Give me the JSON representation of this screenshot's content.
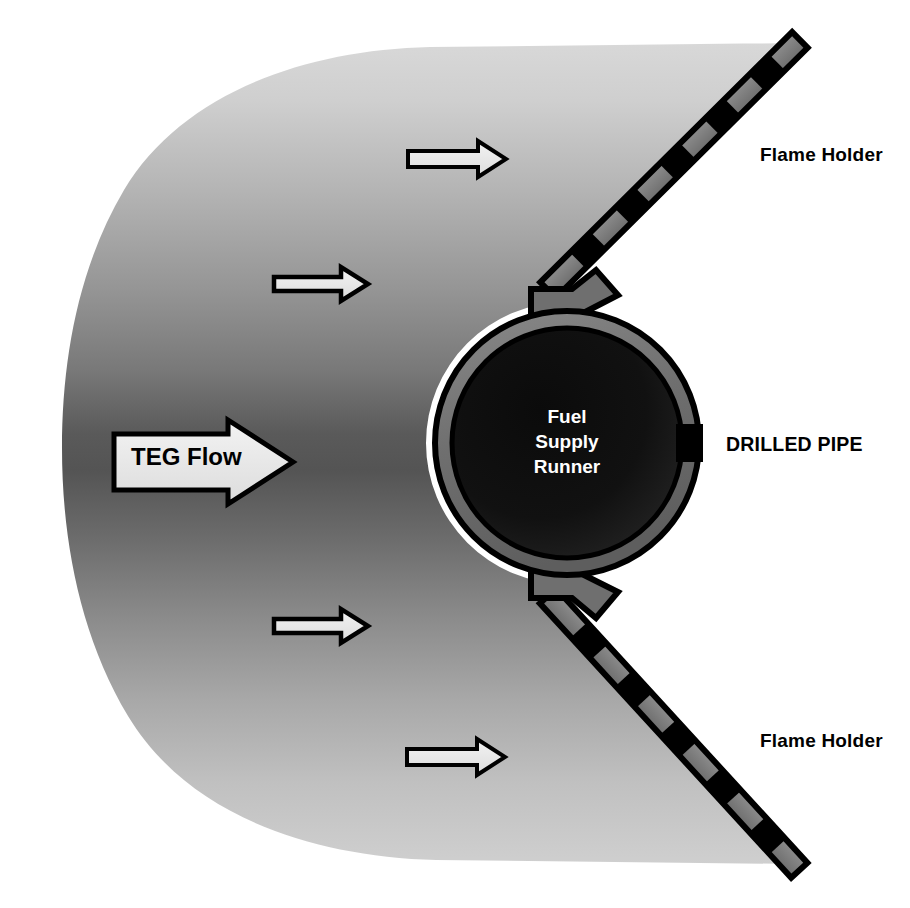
{
  "diagram": {
    "title_present": false,
    "background_color": "#ffffff",
    "labels": {
      "flame_holder_top": "Flame Holder",
      "flame_holder_bottom": "Flame Holder",
      "drilled_pipe": "DRILLED PIPE",
      "teg_flow": "TEG Flow",
      "fuel_supply_runner_line1": "Fuel",
      "fuel_supply_runner_line2": "Supply",
      "fuel_supply_runner_line3": "Runner"
    },
    "colors": {
      "flow_light": "#c9c9c9",
      "flow_dark": "#4a4a4a",
      "pipe_wall": "#6e6e6e",
      "pipe_interior_dark": "#0d0d0d",
      "bar_fill": "#7d7d7d",
      "bar_hole": "#000000",
      "outline": "#000000",
      "arrow_fill": "#ebebeb",
      "runner_text": "#ffffff",
      "label_text": "#000000"
    },
    "flow_arrows": [
      {
        "name": "flow-arrow-top",
        "x": 406,
        "y": 140,
        "width": 102,
        "height": 38,
        "label": ""
      },
      {
        "name": "flow-arrow-upper-mid",
        "x": 272,
        "y": 266,
        "width": 98,
        "height": 37,
        "label": ""
      },
      {
        "name": "flow-arrow-main",
        "x": 112,
        "y": 418,
        "width": 183,
        "height": 88,
        "label": "TEG Flow"
      },
      {
        "name": "flow-arrow-lower-mid",
        "x": 272,
        "y": 608,
        "width": 98,
        "height": 37,
        "label": ""
      },
      {
        "name": "flow-arrow-bottom",
        "x": 405,
        "y": 738,
        "width": 103,
        "height": 38,
        "label": ""
      }
    ],
    "pipe": {
      "name": "drilled-pipe",
      "center_x": 567,
      "center_y": 443,
      "outer_radius": 135,
      "wall_thickness": 17,
      "hole_angle_deg": 0,
      "hole_count": 1
    },
    "flame_holders": [
      {
        "name": "flame-holder-top",
        "x1": 548,
        "y1": 290,
        "x2": 797,
        "y2": 43,
        "hole_count": 5
      },
      {
        "name": "flame-holder-bottom",
        "x1": 548,
        "y1": 596,
        "x2": 797,
        "y2": 868,
        "hole_count": 5
      }
    ]
  }
}
